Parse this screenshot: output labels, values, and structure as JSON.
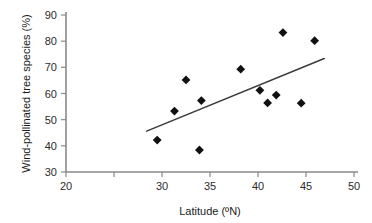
{
  "chart_data": {
    "type": "scatter",
    "title": "",
    "xlabel": "Latitude (ºN)",
    "ylabel": "Wind-pollinated tree species (%)",
    "xlim": [
      20,
      50
    ],
    "ylim": [
      30,
      90
    ],
    "xticks": [
      20,
      25,
      30,
      35,
      40,
      45,
      50
    ],
    "xtick_labels": [
      "20",
      "",
      "30",
      "35",
      "40",
      "45",
      "50"
    ],
    "yticks": [
      30,
      40,
      50,
      60,
      70,
      80,
      90
    ],
    "ytick_labels": [
      "30",
      "40",
      "50",
      "60",
      "70",
      "80",
      "90"
    ],
    "grid": false,
    "legend": false,
    "marker_shape": "diamond",
    "marker_color": "#111111",
    "points": [
      {
        "x": 29.5,
        "y": 42.2
      },
      {
        "x": 31.3,
        "y": 53.3
      },
      {
        "x": 32.5,
        "y": 65.2
      },
      {
        "x": 33.9,
        "y": 38.4
      },
      {
        "x": 34.1,
        "y": 57.3
      },
      {
        "x": 38.2,
        "y": 69.3
      },
      {
        "x": 40.2,
        "y": 61.2
      },
      {
        "x": 41.0,
        "y": 56.4
      },
      {
        "x": 41.9,
        "y": 59.4
      },
      {
        "x": 42.6,
        "y": 83.3
      },
      {
        "x": 44.5,
        "y": 56.3
      },
      {
        "x": 45.9,
        "y": 80.2
      }
    ],
    "trendline": {
      "type": "linear-fit",
      "x_start": 28.4,
      "y_start": 45.6,
      "x_end": 46.9,
      "y_end": 73.4,
      "color": "#3b3b3b"
    }
  }
}
